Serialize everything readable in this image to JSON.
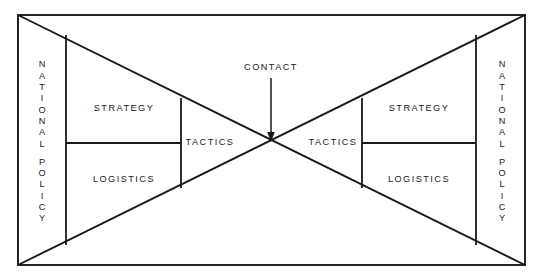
{
  "diagram": {
    "type": "conceptual-diagram",
    "background_color": "#ffffff",
    "line_color": "#1a1a1a",
    "frame": {
      "x1": 18,
      "y1": 15,
      "x2": 525,
      "y2": 265
    },
    "center_point": {
      "x": 271,
      "y": 143,
      "label": "CONTACT"
    },
    "annotation": {
      "label": "CONTACT",
      "label_x": 271,
      "label_y": 68,
      "arrow_from_y": 78,
      "arrow_to_y": 141
    },
    "left_side": {
      "national_policy": {
        "text": "NATIONAL POLICY",
        "word_1": "NATIONAL",
        "word_2": "POLICY",
        "letters_1": [
          "N",
          "A",
          "T",
          "I",
          "O",
          "N",
          "A",
          "L"
        ],
        "letters_2": [
          "P",
          "O",
          "L",
          "I",
          "C",
          "Y"
        ],
        "orientation": "vertical"
      },
      "strategy": {
        "label": "STRATEGY",
        "x": 124,
        "y": 109
      },
      "logistics": {
        "label": "LOGISTICS",
        "x": 124,
        "y": 180
      },
      "tactics": {
        "label": "TACTICS",
        "x": 208,
        "y": 143
      }
    },
    "right_side": {
      "national_policy": {
        "text": "NATIONAL POLICY",
        "word_1": "NATIONAL",
        "word_2": "POLICY",
        "letters_1": [
          "N",
          "A",
          "T",
          "I",
          "O",
          "N",
          "A",
          "L"
        ],
        "letters_2": [
          "P",
          "O",
          "L",
          "I",
          "C",
          "Y"
        ],
        "orientation": "vertical"
      },
      "strategy": {
        "label": "STRATEGY",
        "x": 419,
        "y": 109
      },
      "logistics": {
        "label": "LOGISTICS",
        "x": 419,
        "y": 180
      },
      "tactics": {
        "label": "TACTICS",
        "x": 334,
        "y": 143
      }
    },
    "guides": {
      "left_policy_divider_x": 66,
      "left_inner_divider_x": 181,
      "right_inner_divider_x": 362,
      "right_policy_divider_x": 476,
      "horizontal_divider_y": 143
    }
  }
}
